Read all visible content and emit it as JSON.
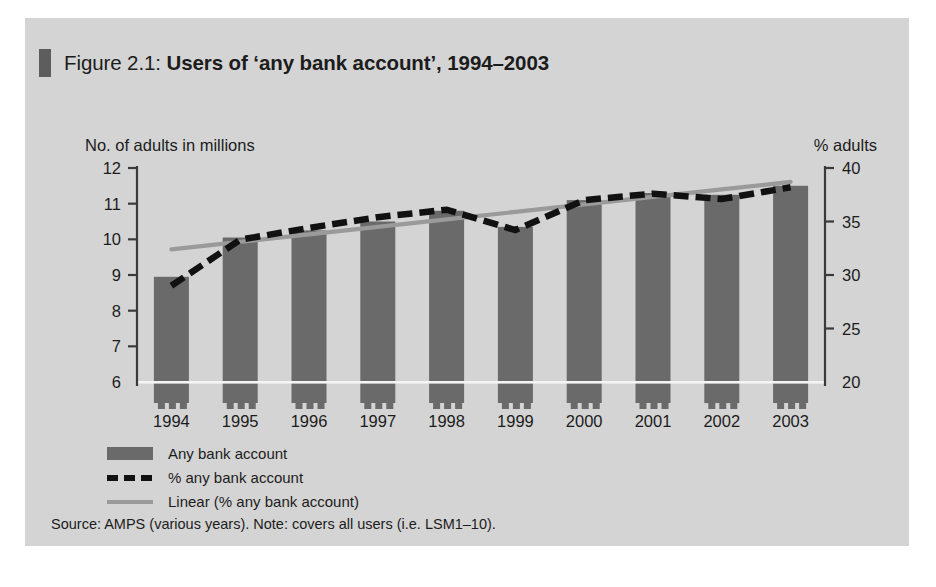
{
  "figure": {
    "number_label": "Figure 2.1:",
    "title": "Users of ‘any bank account’, 1994–2003",
    "accent_color": "#5d5d5d",
    "panel_background": "#d4d4d4"
  },
  "axes": {
    "left_caption": "No. of adults in millions",
    "right_caption": "% adults"
  },
  "legend": {
    "items": [
      {
        "label": "Any bank account",
        "swatch": "bar",
        "color": "#6a6a6a"
      },
      {
        "label": "% any bank account",
        "swatch": "dashed-line",
        "color": "#111111"
      },
      {
        "label": "Linear (% any bank account)",
        "swatch": "solid-line",
        "color": "#9a9a9a"
      }
    ]
  },
  "source_note": "Source: AMPS (various years). Note: covers all users (i.e. LSM1–10).",
  "chart_data": {
    "type": "bar",
    "title": "Users of ‘any bank account’, 1994–2003",
    "xlabel": "",
    "ylabel": "No. of adults in millions",
    "y2label": "% adults",
    "categories": [
      "1994",
      "1995",
      "1996",
      "1997",
      "1998",
      "1999",
      "2000",
      "2001",
      "2002",
      "2003"
    ],
    "ylim": [
      6,
      12
    ],
    "yticks": [
      6,
      7,
      8,
      9,
      10,
      11,
      12
    ],
    "ylim_right": [
      20,
      40
    ],
    "yticks_right": [
      20,
      25,
      30,
      35,
      40
    ],
    "grid": false,
    "legend_position": "below-left",
    "series": [
      {
        "name": "Any bank account",
        "type": "bar",
        "axis": "left",
        "units": "millions of adults",
        "color": "#6a6a6a",
        "values": [
          8.95,
          10.05,
          10.25,
          10.5,
          10.8,
          10.35,
          11.1,
          11.3,
          11.25,
          11.5
        ]
      },
      {
        "name": "% any bank account",
        "type": "line",
        "style": "dashed",
        "axis": "right",
        "units": "percent of adults",
        "color": "#111111",
        "values": [
          29.0,
          33.3,
          34.4,
          35.4,
          36.1,
          34.2,
          37.0,
          37.6,
          37.1,
          38.2
        ]
      },
      {
        "name": "Linear (% any bank account)",
        "type": "line",
        "style": "solid",
        "axis": "right",
        "units": "percent of adults",
        "color": "#9a9a9a",
        "values": [
          32.4,
          33.1,
          33.8,
          34.5,
          35.2,
          35.9,
          36.6,
          37.3,
          38.0,
          38.7
        ]
      }
    ]
  }
}
